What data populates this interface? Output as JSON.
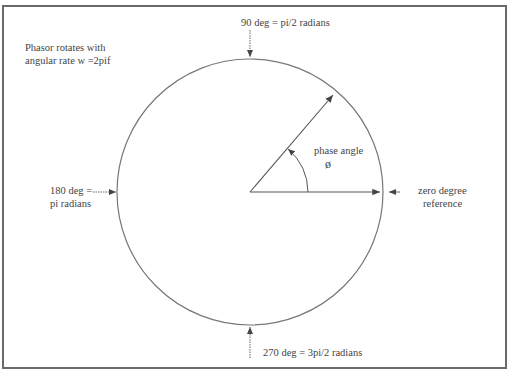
{
  "diagram": {
    "type": "phasor-diagram",
    "note_line1": "Phasor rotates with",
    "note_line2": "angular rate w =2pif",
    "label_90": "90 deg = pi/2 radians",
    "label_180_line1": "180 deg =",
    "label_180_line2": "pi radians",
    "label_270": "270 deg = 3pi/2 radians",
    "label_zero_line1": "zero degree",
    "label_zero_line2": "reference",
    "phase_angle_line1": "phase angle",
    "phase_angle_line2": "ø",
    "colors": {
      "line": "#555555",
      "text": "#444444",
      "border": "#6a6a6a"
    },
    "geometry": {
      "center": [
        250,
        192
      ],
      "radius": 133,
      "phasor_angle_deg": 50
    }
  }
}
